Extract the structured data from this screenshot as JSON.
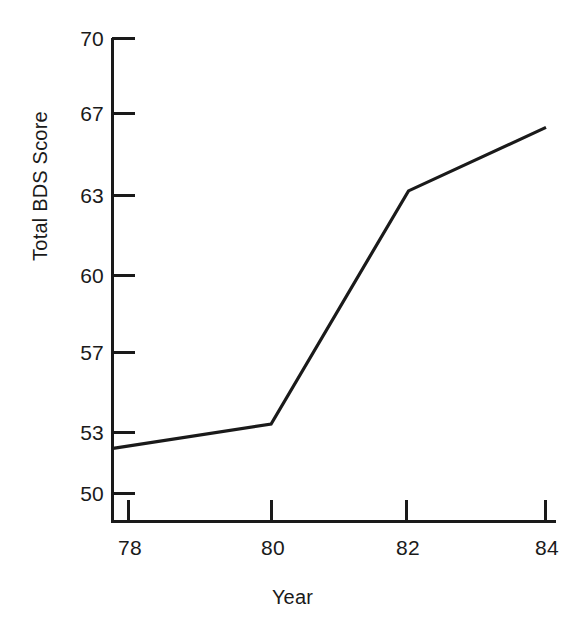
{
  "chart_data": {
    "type": "line",
    "title": "",
    "subtitle": "",
    "xlabel": "Year",
    "ylabel": "Total BDS Score",
    "grid": false,
    "legend": false,
    "legend_position": "none",
    "line_color": "#1a1a1a",
    "background_color": "#ffffff",
    "axis_color": "#1a1a1a",
    "x": [
      78,
      80,
      82,
      84
    ],
    "xtick_labels": [
      "78",
      "80",
      "82",
      "84"
    ],
    "ytick_labels": [
      "70",
      "67",
      "63",
      "60",
      "57",
      "53",
      "50"
    ],
    "ytick_values": [
      70,
      67,
      63,
      60,
      57,
      53,
      50
    ],
    "xlim": [
      77.7,
      84
    ],
    "ylim": [
      48.5,
      70
    ],
    "series": [
      {
        "name": "Total BDS Score",
        "x": [
          77.7,
          80,
          82,
          84
        ],
        "values": [
          52.2,
          53.4,
          63.2,
          66.3
        ]
      }
    ],
    "annotations": []
  },
  "axis_titles": {
    "y": "Total BDS Score",
    "x": "Year"
  }
}
